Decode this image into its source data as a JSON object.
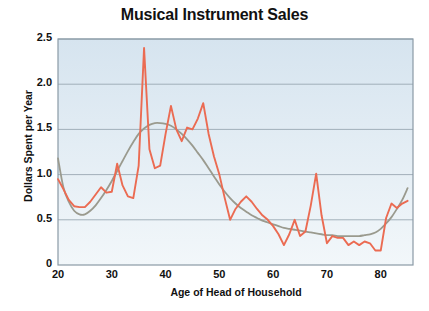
{
  "chart_data": {
    "type": "line",
    "title": "Musical Instrument Sales",
    "xlabel": "Age of Head of Household",
    "ylabel": "Dollars Spent per Year",
    "xlim": [
      20,
      86
    ],
    "ylim": [
      0,
      2.5
    ],
    "xticks": [
      20,
      30,
      40,
      50,
      60,
      70,
      80
    ],
    "xtick_labels": [
      "20",
      "30",
      "40",
      "50",
      "60",
      "70",
      "80"
    ],
    "yticks": [
      0,
      0.5,
      1.0,
      1.5,
      2.0,
      2.5
    ],
    "ytick_labels": [
      "0",
      "0.5",
      "1.0",
      "1.5",
      "2.0",
      "2.5"
    ],
    "grid": "horizontal",
    "legend": "none",
    "plot_bg_top_color": "#d6e4ef",
    "plot_bg_bottom_color": "#f2f7fa",
    "gridline_color": "#9aa8b2",
    "border_color": "#8a9aa6",
    "series": [
      {
        "name": "Dollars spent per year (raw)",
        "color": "#eb6b52",
        "kind": "jagged",
        "x": [
          20,
          21,
          22,
          23,
          24,
          25,
          26,
          27,
          28,
          29,
          30,
          31,
          32,
          33,
          34,
          35,
          36,
          37,
          38,
          39,
          40,
          41,
          42,
          43,
          44,
          45,
          46,
          47,
          48,
          49,
          50,
          51,
          52,
          53,
          54,
          55,
          56,
          57,
          58,
          59,
          60,
          61,
          62,
          63,
          64,
          65,
          66,
          67,
          68,
          69,
          70,
          71,
          72,
          73,
          74,
          75,
          76,
          77,
          78,
          79,
          80,
          81,
          82,
          83,
          84,
          85
        ],
        "y": [
          0.95,
          0.84,
          0.72,
          0.65,
          0.64,
          0.64,
          0.7,
          0.78,
          0.86,
          0.8,
          0.81,
          1.12,
          0.88,
          0.76,
          0.74,
          1.1,
          2.4,
          1.28,
          1.07,
          1.1,
          1.45,
          1.76,
          1.5,
          1.37,
          1.52,
          1.5,
          1.62,
          1.79,
          1.45,
          1.2,
          1.0,
          0.74,
          0.5,
          0.62,
          0.7,
          0.76,
          0.7,
          0.62,
          0.55,
          0.5,
          0.43,
          0.34,
          0.22,
          0.34,
          0.5,
          0.32,
          0.37,
          0.66,
          1.01,
          0.55,
          0.24,
          0.32,
          0.3,
          0.3,
          0.22,
          0.26,
          0.22,
          0.26,
          0.24,
          0.16,
          0.16,
          0.52,
          0.68,
          0.63,
          0.68,
          0.71
        ]
      },
      {
        "name": "Smoothed trend",
        "color": "#9a9a8e",
        "kind": "smooth",
        "x": [
          20,
          21,
          22,
          23,
          24,
          25,
          26,
          27,
          28,
          29,
          30,
          31,
          32,
          33,
          34,
          35,
          36,
          37,
          38,
          39,
          40,
          41,
          42,
          43,
          44,
          45,
          46,
          47,
          48,
          49,
          50,
          51,
          52,
          53,
          54,
          55,
          56,
          57,
          58,
          59,
          60,
          61,
          62,
          63,
          64,
          65,
          66,
          67,
          68,
          69,
          70,
          71,
          72,
          73,
          74,
          75,
          76,
          77,
          78,
          79,
          80,
          81,
          82,
          83,
          84,
          85
        ],
        "y": [
          1.18,
          0.86,
          0.7,
          0.6,
          0.56,
          0.56,
          0.6,
          0.66,
          0.74,
          0.83,
          0.93,
          1.04,
          1.15,
          1.26,
          1.36,
          1.45,
          1.51,
          1.55,
          1.57,
          1.57,
          1.56,
          1.54,
          1.5,
          1.45,
          1.39,
          1.32,
          1.24,
          1.16,
          1.07,
          0.98,
          0.89,
          0.81,
          0.74,
          0.68,
          0.63,
          0.59,
          0.55,
          0.52,
          0.49,
          0.47,
          0.45,
          0.43,
          0.41,
          0.4,
          0.39,
          0.38,
          0.37,
          0.36,
          0.35,
          0.34,
          0.33,
          0.33,
          0.32,
          0.32,
          0.32,
          0.32,
          0.32,
          0.33,
          0.34,
          0.36,
          0.4,
          0.46,
          0.53,
          0.62,
          0.72,
          0.85
        ]
      }
    ]
  }
}
